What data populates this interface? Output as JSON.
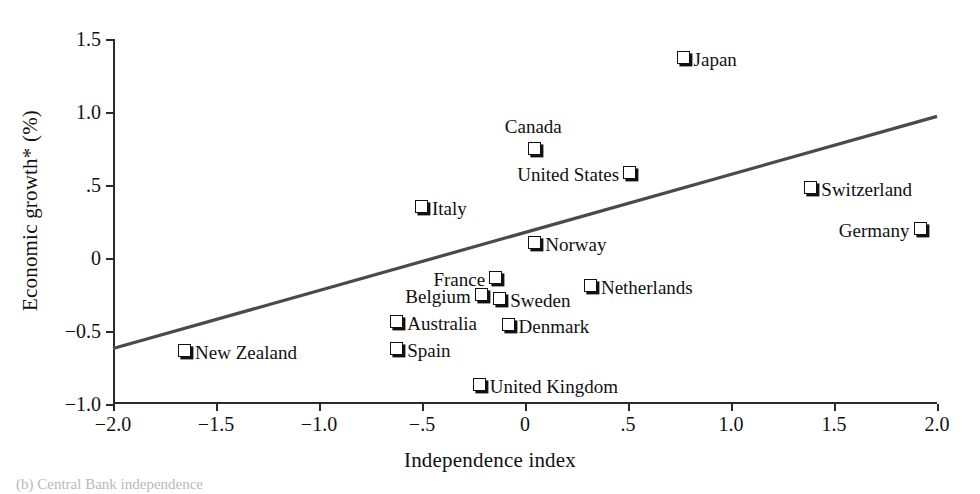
{
  "chart_data": {
    "type": "scatter",
    "title": "",
    "xlabel": "Independence index",
    "ylabel": "Economic growth* (%)",
    "xlim": [
      -2.0,
      2.0
    ],
    "ylim": [
      -1.0,
      1.5
    ],
    "grid": false,
    "legend": "none",
    "xticks": [
      {
        "value": -2.0,
        "label": "−2.0"
      },
      {
        "value": -1.5,
        "label": "−1.5"
      },
      {
        "value": -1.0,
        "label": "−1.0"
      },
      {
        "value": -0.5,
        "label": "−.5"
      },
      {
        "value": 0.0,
        "label": "0"
      },
      {
        "value": 0.5,
        "label": ".5"
      },
      {
        "value": 1.0,
        "label": "1.0"
      },
      {
        "value": 1.5,
        "label": "1.5"
      },
      {
        "value": 2.0,
        "label": "2.0"
      }
    ],
    "yticks": [
      {
        "value": 1.5,
        "label": "1.5"
      },
      {
        "value": 1.0,
        "label": "1.0"
      },
      {
        "value": 0.5,
        "label": ".5"
      },
      {
        "value": 0.0,
        "label": "0"
      },
      {
        "value": -0.5,
        "label": "−0.5"
      },
      {
        "value": -1.0,
        "label": "−1.0"
      }
    ],
    "points": [
      {
        "label": "Japan",
        "x": 0.77,
        "y": 1.37,
        "label_pos": "right"
      },
      {
        "label": "Canada",
        "x": 0.05,
        "y": 0.75,
        "label_pos": "above"
      },
      {
        "label": "United States",
        "x": 0.51,
        "y": 0.58,
        "label_pos": "left"
      },
      {
        "label": "Switzerland",
        "x": 1.39,
        "y": 0.48,
        "label_pos": "right"
      },
      {
        "label": "Italy",
        "x": -0.5,
        "y": 0.35,
        "label_pos": "right"
      },
      {
        "label": "Germany",
        "x": 1.92,
        "y": 0.2,
        "label_pos": "left"
      },
      {
        "label": "Norway",
        "x": 0.05,
        "y": 0.1,
        "label_pos": "right"
      },
      {
        "label": "France",
        "x": -0.14,
        "y": -0.14,
        "label_pos": "left"
      },
      {
        "label": "Netherlands",
        "x": 0.32,
        "y": -0.19,
        "label_pos": "right"
      },
      {
        "label": "Belgium",
        "x": -0.21,
        "y": -0.25,
        "label_pos": "left"
      },
      {
        "label": "Sweden",
        "x": -0.12,
        "y": -0.28,
        "label_pos": "right"
      },
      {
        "label": "Australia",
        "x": -0.62,
        "y": -0.44,
        "label_pos": "right"
      },
      {
        "label": "Denmark",
        "x": -0.08,
        "y": -0.46,
        "label_pos": "right"
      },
      {
        "label": "Spain",
        "x": -0.62,
        "y": -0.62,
        "label_pos": "right"
      },
      {
        "label": "New Zealand",
        "x": -1.65,
        "y": -0.64,
        "label_pos": "right"
      },
      {
        "label": "United Kingdom",
        "x": -0.22,
        "y": -0.87,
        "label_pos": "right"
      }
    ],
    "trendline": {
      "x_start": -2.0,
      "y_start": -0.62,
      "x_end": 2.0,
      "y_end": 0.97,
      "color": "#4a4a4a"
    }
  },
  "caption": {
    "text": "(b)  Central Bank independence"
  }
}
